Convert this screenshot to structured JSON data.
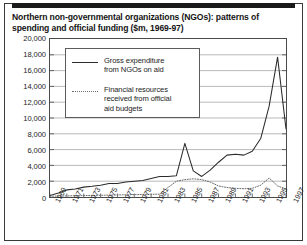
{
  "figure": {
    "title": "Northern non-governmental organizations (NGOs): patterns of spending and official funding ($m, 1969-97)"
  },
  "legend": {
    "items": [
      {
        "style": "solid",
        "label": "Gross expenditure\nfrom NGOs on aid"
      },
      {
        "style": "dotted",
        "label": "Financial resources\nreceived from official\naid budgets"
      }
    ]
  },
  "chart_data": {
    "type": "line",
    "title": "Northern non-governmental organizations (NGOs): patterns of spending and official funding ($m, 1969-97)",
    "xlabel": "",
    "ylabel": "",
    "ylim": [
      0,
      20000
    ],
    "ytick_values": [
      0,
      2000,
      4000,
      6000,
      8000,
      10000,
      12000,
      14000,
      16000,
      18000,
      20000
    ],
    "ytick_labels": [
      "0",
      "2,000",
      "4,000",
      "6,000",
      "8,000",
      "10,000",
      "12,000",
      "14,000",
      "16,000",
      "18,000",
      "20,000"
    ],
    "xlim": [
      1969,
      1997
    ],
    "xtick_values": [
      1969,
      1971,
      1973,
      1975,
      1977,
      1979,
      1981,
      1983,
      1985,
      1987,
      1989,
      1991,
      1993,
      1995,
      1997
    ],
    "xtick_labels": [
      "1969",
      "1971",
      "1973",
      "1975",
      "1977",
      "1979",
      "1981",
      "1983",
      "1985",
      "1987",
      "1989",
      "1991",
      "1993",
      "1995",
      "1997"
    ],
    "grid": true,
    "legend_position": "upper-left-inset",
    "x": [
      1969,
      1970,
      1971,
      1972,
      1973,
      1974,
      1975,
      1976,
      1977,
      1978,
      1979,
      1980,
      1981,
      1982,
      1983,
      1984,
      1985,
      1986,
      1987,
      1988,
      1989,
      1990,
      1991,
      1992,
      1993,
      1994,
      1995,
      1996,
      1997
    ],
    "series": [
      {
        "name": "Gross expenditure from NGOs on aid",
        "style": "solid",
        "values": [
          200,
          500,
          900,
          1000,
          1250,
          1350,
          1500,
          1700,
          1700,
          1900,
          2000,
          2100,
          2350,
          2600,
          2600,
          2700,
          6800,
          3300,
          2600,
          3400,
          4400,
          5300,
          5400,
          5300,
          5800,
          7400,
          11500,
          17700,
          8600
        ]
      },
      {
        "name": "Financial resources received from official aid budgets",
        "style": "dotted",
        "values": [
          100,
          120,
          140,
          160,
          180,
          200,
          220,
          240,
          260,
          280,
          300,
          320,
          340,
          360,
          1200,
          2000,
          2200,
          2300,
          2200,
          1900,
          1400,
          1200,
          1100,
          1050,
          1100,
          1500,
          2400,
          1400,
          1000
        ]
      }
    ]
  }
}
